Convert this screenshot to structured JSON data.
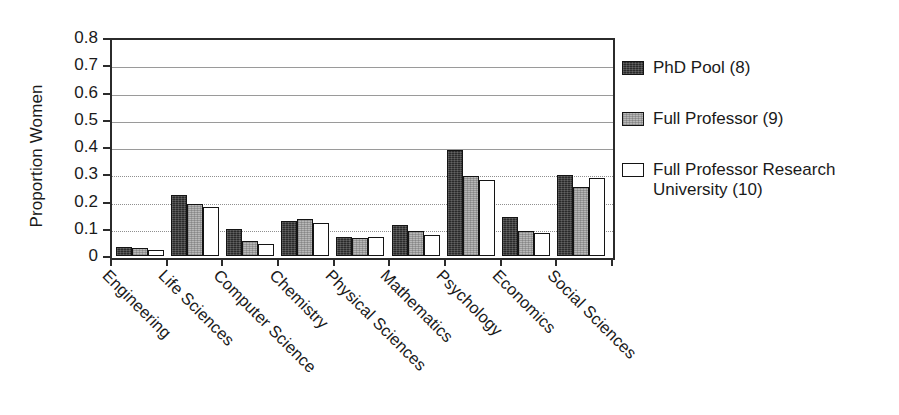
{
  "chart_data": {
    "type": "bar",
    "title": "",
    "xlabel": "",
    "ylabel": "Proportion Women",
    "ylim": [
      0,
      0.8
    ],
    "ytick_labels": [
      "0.8",
      "0.7",
      "0.6",
      "0.5",
      "0.4",
      "0.3",
      "0.2",
      "0.1",
      "0"
    ],
    "ytick_values": [
      0.8,
      0.7,
      0.6,
      0.5,
      0.4,
      0.3,
      0.2,
      0.1,
      0
    ],
    "grid": true,
    "legend_position": "right",
    "categories": [
      "Engineering",
      "Life Sciences",
      "Computer Science",
      "Chemistry",
      "Physical Sciences",
      "Mathematics",
      "Psychology",
      "Economics",
      "Social Sciences"
    ],
    "series": [
      {
        "name": "PhD Pool (8)",
        "color": "#2a2a2a",
        "values": [
          0.033,
          0.225,
          0.1,
          0.127,
          0.068,
          0.115,
          0.39,
          0.145,
          0.297
        ]
      },
      {
        "name": "Full Professor (9)",
        "color": "#b8b8b8",
        "values": [
          0.028,
          0.19,
          0.055,
          0.136,
          0.065,
          0.092,
          0.292,
          0.09,
          0.252
        ]
      },
      {
        "name": "Full Professor Research University (10)",
        "color": "#ffffff",
        "values": [
          0.022,
          0.18,
          0.045,
          0.12,
          0.068,
          0.078,
          0.28,
          0.085,
          0.285
        ]
      }
    ]
  },
  "legend": {
    "items": [
      {
        "label": "PhD Pool (8)",
        "swatch": "dark-filled-swatch"
      },
      {
        "label": "Full Professor (9)",
        "swatch": "gray-filled-swatch"
      },
      {
        "label": "Full Professor Research\nUniversity (10)",
        "swatch": "white-outline-swatch"
      }
    ]
  },
  "axis": {
    "y_title": "Proportion Women"
  }
}
